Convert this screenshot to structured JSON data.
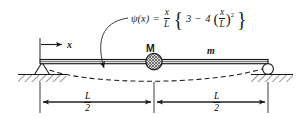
{
  "figure": {
    "background_color": "#ffffff",
    "line_color": "#1a1a1a"
  },
  "equation": {
    "function_name": "ψ(x)",
    "equals": "=",
    "leading_fraction": {
      "numerator": "x",
      "denominator": "L"
    },
    "brace_open": "{",
    "first_term": "3",
    "minus": "−",
    "coefficient": "4",
    "paren_open": "(",
    "inner_fraction": {
      "numerator": "x",
      "denominator": "L"
    },
    "paren_close": ")",
    "exponent": "2",
    "brace_close": "}",
    "plain_text": "ψ(x) = (x/L){3 − 4(x/L)²}"
  },
  "labels": {
    "axis_x": "x",
    "mass_point": "M",
    "beam_mass": "m"
  },
  "dimensions": [
    {
      "name": "left-half-span",
      "numerator": "L",
      "denominator": "2"
    },
    {
      "name": "right-half-span",
      "numerator": "L",
      "denominator": "2"
    }
  ],
  "supports": {
    "left": "pinned-support",
    "right": "roller-support"
  },
  "curves": {
    "deflected_shape": "dashed-sagging-curve",
    "leader": "curved-arrow-to-deflection-curve"
  }
}
